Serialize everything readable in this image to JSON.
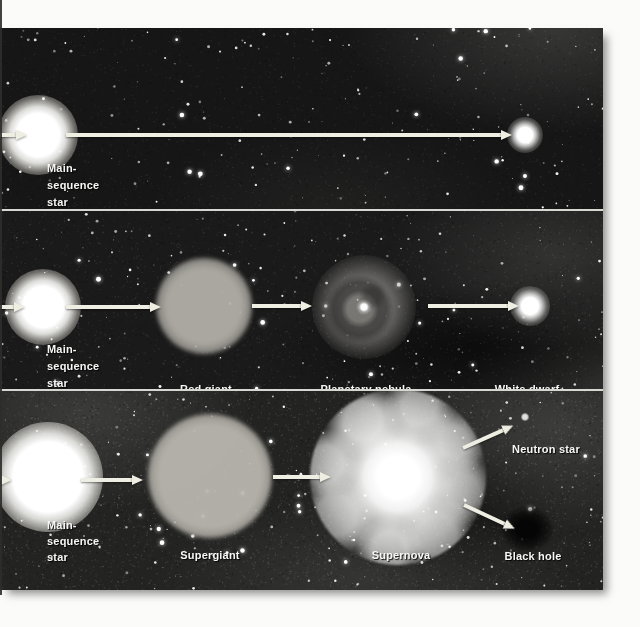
{
  "figure": {
    "colors": {
      "page_bg": "#fbfbf9",
      "panel_bg": "#161616",
      "arrow": "#efeee3",
      "label_text": "#f6f6f4",
      "separator": "#d8d8d2"
    },
    "rows": [
      {
        "name": "low-mass-path",
        "stages": [
          {
            "object": "main-sequence-star",
            "label_lines": [
              "Main-",
              "sequence",
              "star"
            ]
          },
          {
            "object": "white-dwarf",
            "label": "White dwarf"
          }
        ]
      },
      {
        "name": "medium-mass-path",
        "stages": [
          {
            "object": "main-sequence-star",
            "label_lines": [
              "Main-",
              "sequence",
              "star"
            ]
          },
          {
            "object": "red-giant",
            "label": "Red giant"
          },
          {
            "object": "planetary-nebula",
            "label": "Planetary nebula"
          },
          {
            "object": "white-dwarf",
            "label": "White dwarf"
          }
        ]
      },
      {
        "name": "high-mass-path",
        "stages": [
          {
            "object": "main-sequence-star",
            "label_lines": [
              "Main-",
              "sequence",
              "star"
            ]
          },
          {
            "object": "supergiant",
            "label": "Supergiant"
          },
          {
            "object": "supernova",
            "label": "Supernova"
          },
          {
            "object": "neutron-star",
            "label": "Neutron star"
          },
          {
            "object": "black-hole",
            "label": "Black hole"
          }
        ]
      }
    ]
  }
}
